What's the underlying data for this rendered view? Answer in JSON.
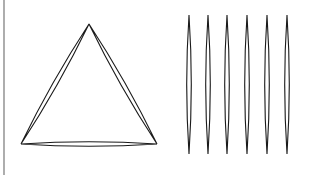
{
  "diagram": {
    "background": "#ffffff",
    "stroke_color": "#1a1a1a",
    "divider": {
      "x": 4,
      "y1": 0,
      "y2": 175,
      "color": "#777777"
    },
    "triangle": {
      "shape": "triangle of three lens (needle) shapes",
      "vertices": [
        [
          89,
          24
        ],
        [
          21,
          144
        ],
        [
          157,
          144
        ]
      ],
      "lens_bulge": 2.2
    },
    "needles": {
      "count": 6,
      "centers_x": [
        189,
        208,
        227,
        247,
        267,
        287
      ],
      "y_top": 15,
      "y_bottom": 154,
      "half_width": 2.3
    }
  }
}
